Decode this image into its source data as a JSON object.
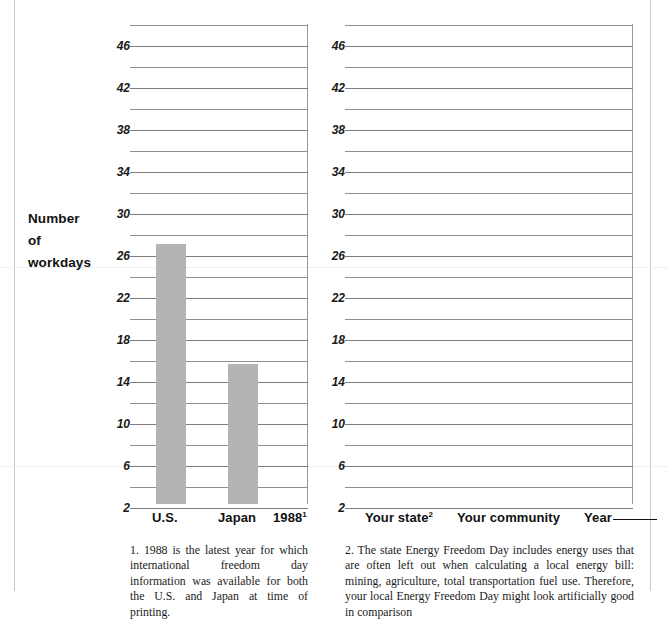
{
  "axis_caption": {
    "line1": "Number",
    "line2": "of",
    "line3": "workdays"
  },
  "chart_data": {
    "type": "bar",
    "title": "",
    "xlabel": "",
    "ylabel": "Number of workdays",
    "ylim": [
      0,
      48
    ],
    "ytick_step": 4,
    "gridline_step": 2,
    "grid": true,
    "legend": "none",
    "panels": [
      {
        "name": "international-panel",
        "categories": [
          "U.S.",
          "Japan"
        ],
        "values": [
          26,
          14
        ],
        "bar_color": "#b4b4b4",
        "ytick_labels": [
          46,
          42,
          38,
          34,
          30,
          26,
          22,
          18,
          14,
          10,
          6,
          2
        ],
        "axis_year_label": "1988",
        "axis_year_footnote_marker": "1"
      },
      {
        "name": "local-blank-panel",
        "categories": [
          "Your state",
          "Your community"
        ],
        "values": [],
        "bar_color": "#b4b4b4",
        "ytick_labels": [
          46,
          42,
          38,
          34,
          30,
          26,
          22,
          18,
          14,
          10,
          6,
          2
        ],
        "state_footnote_marker": "2",
        "year_label": "Year",
        "year_blank": true
      }
    ]
  },
  "left_chart": {
    "ytick_labels": [
      "46",
      "42",
      "38",
      "34",
      "30",
      "26",
      "22",
      "18",
      "14",
      "10",
      "6",
      "2"
    ],
    "xlabels": {
      "us": "U.S.",
      "japan": "Japan",
      "year": "1988",
      "year_sup": "1"
    }
  },
  "right_chart": {
    "ytick_labels": [
      "46",
      "42",
      "38",
      "34",
      "30",
      "26",
      "22",
      "18",
      "14",
      "10",
      "6",
      "2"
    ],
    "xlabels": {
      "state": "Your state",
      "state_sup": "2",
      "community": "Your community",
      "year": "Year"
    }
  },
  "footnotes": {
    "note1": "1. 1988 is the latest year for which international freedom day information was available for both the U.S. and Japan at time of printing.",
    "note2": "2. The state Energy Freedom Day includes energy uses that are often left out when calculating a local energy bill: mining, agriculture, total transportation fuel use. Therefore, your local Energy Freedom Day might look artificially good in comparison"
  }
}
